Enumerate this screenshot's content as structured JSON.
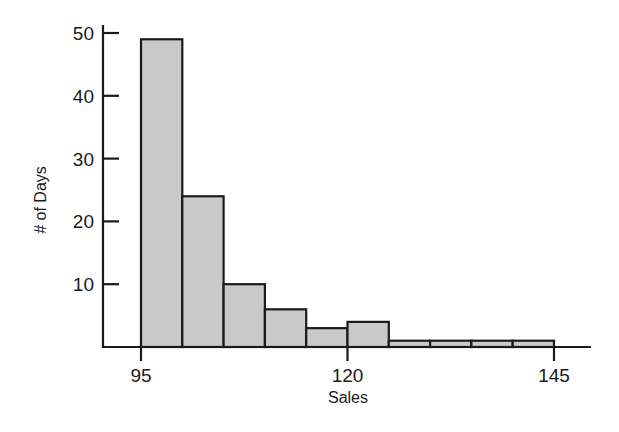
{
  "chart_data": {
    "type": "bar",
    "title": "",
    "subtitle": "",
    "xlabel": "Sales",
    "ylabel": "# of Days",
    "bin_width": 5,
    "bin_edges": [
      95,
      100,
      105,
      110,
      115,
      120,
      125,
      130,
      135,
      140,
      145
    ],
    "categories": [
      "95-100",
      "100-105",
      "105-110",
      "110-115",
      "115-120",
      "120-125",
      "125-130",
      "130-135",
      "135-140",
      "140-145"
    ],
    "values": [
      49,
      24,
      10,
      6,
      3,
      4,
      1,
      1,
      1,
      1
    ],
    "x": [
      97.5,
      102.5,
      107.5,
      112.5,
      117.5,
      122.5,
      127.5,
      132.5,
      137.5,
      142.5
    ],
    "xlim": [
      95,
      145
    ],
    "ylim": [
      0,
      52
    ],
    "xticks": [
      95,
      120,
      145
    ],
    "xtick_labels": [
      "95",
      "120",
      "145"
    ],
    "yticks": [
      10,
      20,
      30,
      40,
      50
    ],
    "ytick_labels": [
      "10",
      "20",
      "30",
      "40",
      "50"
    ],
    "grid": false,
    "legend": false,
    "legend_position": "none",
    "bar_fill_color": "#c9c9c9",
    "bar_edge_color": "#1a1a1a",
    "axis_color": "#1a1a1a",
    "background_color": "#ffffff"
  }
}
